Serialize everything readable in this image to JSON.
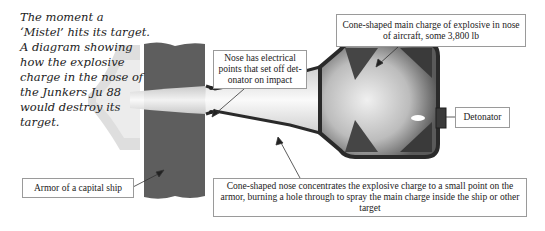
{
  "caption": "The moment a ‘Mistel’ hits its target. A diagram showing how the explosive charge in the nose of the Junkers Ju 88 would destroy its target.",
  "labels": {
    "armor": "Armor of a capital ship",
    "nose": "Nose has electrical points that set off det-onator on impact",
    "main_charge": "Cone-shaped main charge of explosive in nose of aircraft, some 3,800 lb",
    "detonator": "Detonator",
    "cone_nose": "Cone-shaped nose concentrates the explosive charge to a small point on the armor, burning a hole through to spray the main charge inside the ship or other target"
  },
  "colors": {
    "armor": "#5e5e5e",
    "casing": "#2a2a2a",
    "label_border": "#9a9a9a",
    "text": "#222222"
  }
}
